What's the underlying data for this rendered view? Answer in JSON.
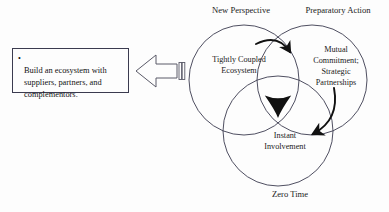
{
  "diagram": {
    "background_color": "#fdfdfd",
    "stroke_color": "#3b3b4f",
    "fill_color": "#111111"
  },
  "callout": {
    "bullet_glyph": "•",
    "text": "Build an ecosystem with suppliers, partners, and complementors.",
    "border_color": "#3b3b4f",
    "background_color": "#fdfdfd"
  },
  "block_arrow": {
    "direction": "left",
    "icon": "left-block-arrow-icon",
    "tail_stripes": 3
  },
  "venn": {
    "outer_labels": [
      {
        "id": "new-perspective",
        "text": "New Perspective"
      },
      {
        "id": "preparatory-action",
        "text": "Preparatory Action"
      },
      {
        "id": "zero-time",
        "text": "Zero Time"
      }
    ],
    "circles": [
      {
        "id": "tightly-coupled-ecosystem",
        "label": "Tightly Coupled\nEcosystem",
        "cx": 244,
        "cy": 80,
        "r": 55
      },
      {
        "id": "mutual-commitment-strategic-partnerships",
        "label": "Mutual\nCommitment;\nStrategic\nPartnerships",
        "cx": 312,
        "cy": 80,
        "r": 55
      },
      {
        "id": "instant-involvement",
        "label": "Instant\nInvolvement",
        "cx": 278,
        "cy": 131,
        "r": 55
      }
    ],
    "curved_arrows": [
      {
        "id": "arrow-perspective-to-preparation",
        "from": "tightly-coupled-ecosystem",
        "to": "mutual-commitment-strategic-partnerships"
      },
      {
        "id": "arrow-preparation-to-involvement",
        "from": "mutual-commitment-strategic-partnerships",
        "to": "instant-involvement"
      }
    ],
    "center_marker": "filled-triple-intersection-wedge"
  }
}
